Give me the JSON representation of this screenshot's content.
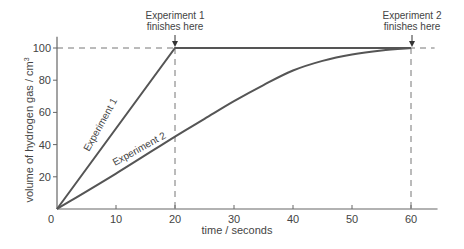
{
  "chart_data": {
    "type": "line",
    "title": "",
    "xlabel": "time / seconds",
    "ylabel": "volume of hydrogen gas / cm³",
    "xlim": [
      0,
      64
    ],
    "ylim": [
      0,
      108
    ],
    "x_ticks": [
      0,
      10,
      20,
      30,
      40,
      50,
      60
    ],
    "y_ticks": [
      20,
      40,
      60,
      80,
      100
    ],
    "grid": false,
    "series": [
      {
        "name": "Experiment 1",
        "x": [
          0,
          20,
          60
        ],
        "y": [
          0,
          100,
          100
        ]
      },
      {
        "name": "Experiment 2",
        "x": [
          0,
          10,
          20,
          25,
          30,
          35,
          40,
          45,
          50,
          55,
          60
        ],
        "y": [
          0,
          22,
          45,
          56,
          67,
          77,
          86,
          92,
          96,
          98.5,
          100
        ]
      }
    ],
    "annotations": [
      {
        "text_lines": [
          "Experiment 1",
          "finishes here"
        ],
        "x": 20,
        "y": 100,
        "arrow": true
      },
      {
        "text_lines": [
          "Experiment 2",
          "finishes here"
        ],
        "x": 60,
        "y": 100,
        "arrow": true
      }
    ],
    "reference_lines": [
      {
        "type": "horizontal",
        "y": 100,
        "style": "dashed"
      },
      {
        "type": "vertical",
        "x": 20,
        "style": "dashed"
      },
      {
        "type": "vertical",
        "x": 60,
        "style": "dashed"
      }
    ],
    "line_labels": [
      {
        "text": "Experiment 1",
        "series": 0
      },
      {
        "text": "Experiment 2",
        "series": 1
      }
    ],
    "colors": {
      "line": "#555555",
      "axis": "#666666",
      "text": "#444444"
    }
  }
}
